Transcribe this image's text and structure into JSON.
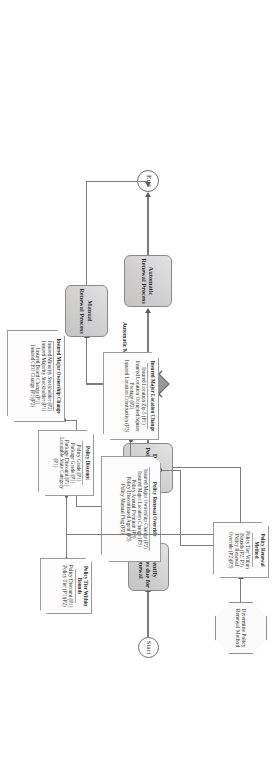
{
  "diagram": {
    "orientation_note": "landscape diagram rendered rotated 90 degrees in a portrait frame",
    "nodes": {
      "start": {
        "label": "Start",
        "shape": "terminator"
      },
      "end": {
        "label": "End",
        "shape": "terminator"
      },
      "identify": {
        "label": "Identify Policies due for Renewal",
        "shape": "process"
      },
      "determine": {
        "label": "Determine Policy Renewal Method",
        "shape": "process"
      },
      "automatic": {
        "label": "Automatic Renewal Process",
        "shape": "process"
      },
      "manual": {
        "label": "Manual Renewal Process",
        "shape": "process"
      },
      "decision": {
        "label": "",
        "shape": "decision"
      },
      "determine_octagon": {
        "label": "Determine Policy Renewal Method",
        "shape": "octagon"
      }
    },
    "edge_labels": {
      "automatic_manual": "Automatic/Manual Renewal"
    },
    "notes": [
      {
        "id": "policy-renewal-method",
        "header": "Policy Renewal Method",
        "items": [
          "Policy Tier Within Bounds (P2, P3)",
          "Policy Renewal Override (P2)(P3)"
        ]
      },
      {
        "id": "policy-renewal-override",
        "header": "Policy Renewal Override",
        "items": [
          "Insured Major Ownership Change (P2)",
          "Insured Major Location Change (P3)",
          "Policy Annual Premium (P3)",
          "Policy Discontinued Agent (P3)",
          "Policy Manual Flag (P2)"
        ]
      },
      {
        "id": "insured-major-location-change",
        "header": "Insured Major Location Change",
        "items": [
          "Insured Location Zip-5 (P1)",
          "Insured Location Occupied Square Footage (P2)",
          "Insured Location Construction (P3)"
        ]
      },
      {
        "id": "insured-major-ownership-change",
        "header": "Insured Major Ownership Change",
        "items": [
          "Insured Minority Stockholder (P2)",
          "Insured Majority Stockholder (P1)",
          "Insured Board Change (P1)",
          "Insured CEO Change (P1)(P2)"
        ]
      },
      {
        "id": "policy-tier-within-bounds",
        "header": "Policy Tier Within Bounds",
        "items": [
          "Policy Discount (P1)",
          "Policy Tier (P1)(P2)"
        ]
      },
      {
        "id": "policy-discount",
        "header": "Policy Discount",
        "items": [
          "Policy Grade (P1)",
          "Package Grade (P1)",
          "Package Discount (P1)",
          "Locatable State Category (P1)"
        ]
      }
    ],
    "colors": {
      "process_fill": "#d3d3d3",
      "process_stroke": "#8a8a8a",
      "decision_fill": "#8e8e8e",
      "line": "#7d7d7d",
      "note_fill": "#fdfdfd",
      "text": "#2b2b2b"
    }
  }
}
